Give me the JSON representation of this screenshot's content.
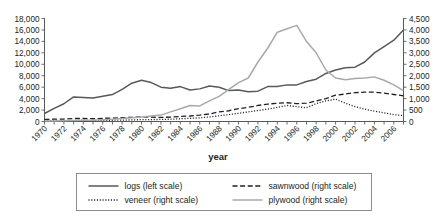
{
  "chart_data": {
    "type": "line",
    "title": "",
    "xlabel": "year",
    "ylabel": "",
    "x": [
      1970,
      1971,
      1972,
      1973,
      1974,
      1975,
      1976,
      1977,
      1978,
      1979,
      1980,
      1981,
      1982,
      1983,
      1984,
      1985,
      1986,
      1987,
      1988,
      1989,
      1990,
      1991,
      1992,
      1993,
      1994,
      1995,
      1996,
      1997,
      1998,
      1999,
      2000,
      2001,
      2002,
      2003,
      2004,
      2005,
      2006,
      2007
    ],
    "xtick_labels": [
      "1970",
      "1972",
      "1974",
      "1976",
      "1978",
      "1980",
      "1982",
      "1984",
      "1986",
      "1988",
      "1990",
      "1992",
      "1994",
      "1996",
      "2002",
      "2004",
      "2006"
    ],
    "xticks": [
      1970,
      1972,
      1974,
      1976,
      1978,
      1980,
      1982,
      1984,
      1986,
      1988,
      1990,
      1992,
      1994,
      1996,
      1998,
      2000,
      2002,
      2004,
      2006
    ],
    "xlim": [
      1970,
      2007
    ],
    "left_axis": {
      "label": "",
      "ylim": [
        0,
        18000
      ],
      "ticks": [
        0,
        2000,
        4000,
        6000,
        8000,
        10000,
        12000,
        14000,
        16000,
        18000
      ],
      "tick_labels": [
        "0",
        "2,000",
        "4,000",
        "6,000",
        "8,000",
        "10,000",
        "12,000",
        "14,000",
        "16,000",
        "18,000"
      ],
      "scale_name": "left scale"
    },
    "right_axis": {
      "label": "",
      "ylim": [
        0,
        4500
      ],
      "ticks": [
        0,
        500,
        1000,
        1500,
        2000,
        2500,
        3000,
        3500,
        4000,
        4500
      ],
      "tick_labels": [
        "0",
        "500",
        "1,000",
        "1,500",
        "2,000",
        "2,500",
        "3,000",
        "3,500",
        "4,000",
        "4,500"
      ],
      "scale_name": "right scale"
    },
    "grid": false,
    "legend_position": "bottom",
    "series": [
      {
        "name": "logs (left scale)",
        "key": "logs",
        "axis": "left",
        "style": "solid",
        "color": "#58595b",
        "width": 1.5,
        "values": [
          1400,
          2300,
          3100,
          4300,
          4200,
          4100,
          4400,
          4700,
          5600,
          6700,
          7200,
          6800,
          6000,
          5800,
          6100,
          5500,
          5700,
          6200,
          6000,
          5400,
          5500,
          5200,
          5300,
          6100,
          6100,
          6400,
          6400,
          7000,
          7400,
          8400,
          9000,
          9400,
          9500,
          10400,
          12000,
          13100,
          14200,
          16000
        ]
      },
      {
        "name": "sawnwood (right scale)",
        "key": "sawnwood",
        "axis": "right",
        "style": "dashed",
        "color": "#231f20",
        "width": 1.3,
        "values": [
          90,
          100,
          110,
          130,
          130,
          120,
          140,
          150,
          170,
          180,
          200,
          190,
          180,
          190,
          220,
          240,
          280,
          330,
          420,
          470,
          560,
          620,
          700,
          760,
          800,
          820,
          780,
          800,
          900,
          1000,
          1150,
          1200,
          1260,
          1280,
          1280,
          1240,
          1180,
          1120
        ]
      },
      {
        "name": "veneer (right scale)",
        "key": "veneer",
        "axis": "right",
        "style": "dotted",
        "color": "#231f20",
        "width": 1.3,
        "values": [
          20,
          25,
          30,
          40,
          45,
          40,
          50,
          55,
          60,
          70,
          80,
          85,
          90,
          100,
          120,
          140,
          160,
          200,
          250,
          300,
          360,
          420,
          480,
          540,
          620,
          700,
          650,
          600,
          780,
          900,
          980,
          800,
          650,
          540,
          450,
          380,
          300,
          260
        ]
      },
      {
        "name": "plywood (right scale)",
        "key": "plywood",
        "axis": "right",
        "style": "solid",
        "color": "#a7a9ac",
        "width": 1.5,
        "values": [
          20,
          25,
          30,
          40,
          50,
          60,
          80,
          100,
          130,
          160,
          200,
          240,
          280,
          420,
          560,
          700,
          680,
          900,
          1100,
          1400,
          1700,
          1900,
          2600,
          3200,
          3900,
          4050,
          4200,
          3500,
          3000,
          2250,
          1900,
          1820,
          1880,
          1900,
          1950,
          1800,
          1600,
          1350
        ]
      }
    ]
  },
  "legend": {
    "entries": [
      {
        "label": "logs (left scale)",
        "style": "solid",
        "color": "#58595b"
      },
      {
        "label": "sawnwood (right scale)",
        "style": "dashed",
        "color": "#231f20"
      },
      {
        "label": "veneer (right scale)",
        "style": "dotted",
        "color": "#231f20"
      },
      {
        "label": "plywood (right scale)",
        "style": "solid",
        "color": "#a7a9ac"
      }
    ]
  },
  "colors": {
    "axis": "#58595b",
    "text": "#231f20",
    "logs": "#58595b",
    "plywood": "#a7a9ac",
    "dark": "#231f20",
    "background": "#ffffff",
    "legend_border": "#808285"
  }
}
